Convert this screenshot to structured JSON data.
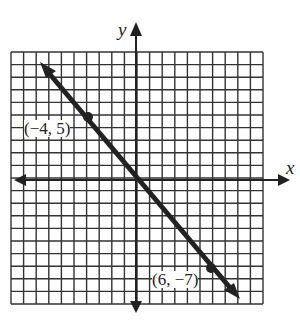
{
  "chart_data": {
    "type": "line",
    "title": "",
    "xlabel": "x",
    "ylabel": "y",
    "xlim": [
      -10,
      10
    ],
    "ylim": [
      -10,
      10
    ],
    "grid": true,
    "series": [
      {
        "name": "line",
        "points": [
          [
            -8,
            9.67
          ],
          [
            -4,
            5
          ],
          [
            6,
            -7
          ],
          [
            8,
            -9.33
          ]
        ],
        "slope": -1.2,
        "intercept": 0.2
      }
    ],
    "annotations": [
      {
        "text": "(−4, 5)",
        "x": -4,
        "y": 5
      },
      {
        "text": "(6, −7)",
        "x": 6,
        "y": -7
      }
    ]
  },
  "labels": {
    "x_axis": "x",
    "y_axis": "y",
    "point1": "(−4, 5)",
    "point2": "(6, −7)",
    "top_fragment": "3"
  }
}
